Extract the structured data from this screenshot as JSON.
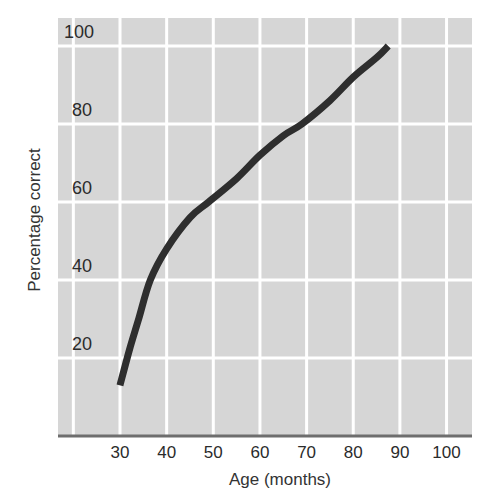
{
  "chart_data": {
    "type": "line",
    "title": "",
    "xlabel": "Age (months)",
    "ylabel": "Percentage correct",
    "xlim": [
      17,
      105
    ],
    "ylim": [
      0,
      100
    ],
    "x_ticks": [
      30,
      40,
      50,
      60,
      70,
      80,
      90,
      100
    ],
    "y_ticks": [
      20,
      40,
      60,
      80,
      100
    ],
    "grid": true,
    "legend": null,
    "series": [
      {
        "name": "Percentage correct",
        "color": "#2e2e2e",
        "x": [
          30,
          32,
          34,
          36.5,
          40,
          45,
          49,
          55,
          60,
          65,
          69,
          75,
          80,
          85,
          87.5
        ],
        "y": [
          13,
          22,
          30,
          40,
          48,
          56,
          60,
          66,
          72,
          77,
          80,
          86,
          92,
          97,
          100
        ]
      }
    ]
  },
  "style": {
    "plot_bg": "#d6d6d6",
    "grid_color": "#ffffff",
    "axis_color": "#6e6e6e",
    "line_color": "#2e2e2e"
  },
  "labels": {
    "xlabel": "Age (months)",
    "ylabel": "Percentage correct"
  }
}
